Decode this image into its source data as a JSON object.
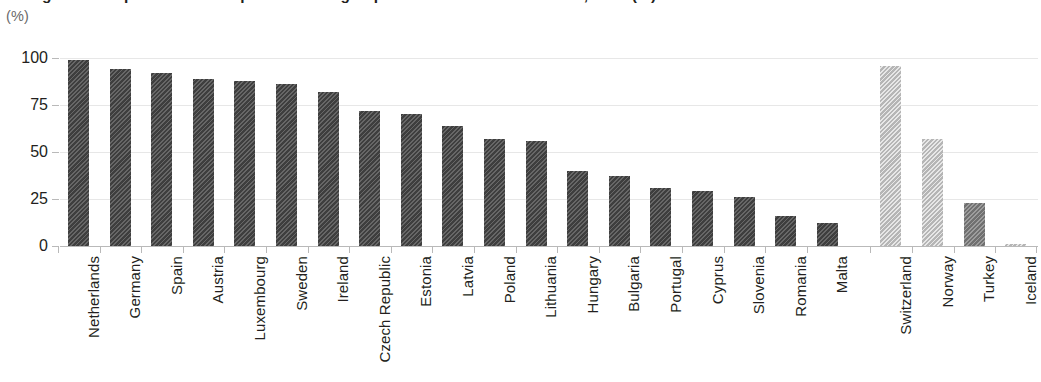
{
  "figure": {
    "title_sliver": "Figure 1. Proportion of enterprises with high-speed broadband connection, 2019 (%)",
    "unit_label": "(%)"
  },
  "chart_data": {
    "type": "bar",
    "title": "",
    "xlabel": "",
    "ylabel": "(%)",
    "ylim": [
      0,
      100
    ],
    "yticks": [
      "0",
      "25",
      "50",
      "75",
      "100"
    ],
    "grid": true,
    "legend": "none",
    "categories": [
      "Netherlands",
      "Germany",
      "Spain",
      "Austria",
      "Luxembourg",
      "Sweden",
      "Ireland",
      "Czech Republic",
      "Estonia",
      "Latvia",
      "Poland",
      "Lithuania",
      "Hungary",
      "Bulgaria",
      "Portugal",
      "Cyprus",
      "Slovenia",
      "Romania",
      "Malta",
      "Switzerland",
      "Norway",
      "Turkey",
      "Iceland"
    ],
    "values": [
      99,
      94,
      92,
      89,
      88,
      86,
      82,
      72,
      70,
      64,
      57,
      56,
      40,
      37,
      31,
      29,
      26,
      16,
      12,
      96,
      57,
      23,
      1
    ],
    "groups": [
      "eu",
      "eu",
      "eu",
      "eu",
      "eu",
      "eu",
      "eu",
      "eu",
      "eu",
      "eu",
      "eu",
      "eu",
      "eu",
      "eu",
      "eu",
      "eu",
      "eu",
      "eu",
      "eu",
      "non-eu-light",
      "non-eu-light",
      "non-eu-mid",
      "non-eu-light"
    ]
  },
  "colors": {
    "bar_dark": "#4a4a4a",
    "bar_mid": "#828282",
    "bar_light": "#cacaca",
    "gridline": "#e7e7e7",
    "axis": "#b9b9b9",
    "text": "#231f20",
    "unit_text": "#6a6a6a"
  }
}
